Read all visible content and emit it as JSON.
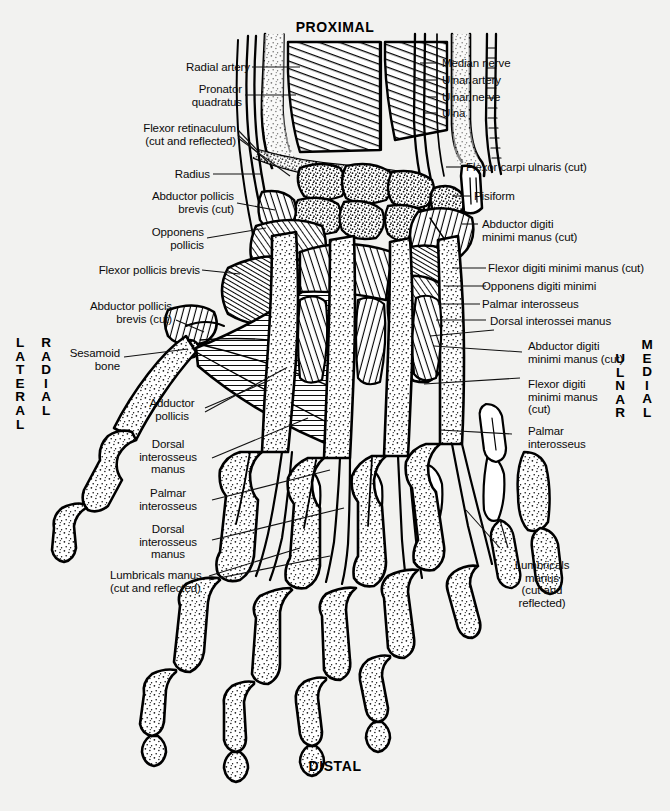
{
  "figure": {
    "title_top": "PROXIMAL",
    "title_bottom": "DISTAL",
    "orientation": {
      "left_outer": "L\nA\nT\nE\nR\nA\nL",
      "left_inner": "R\nA\nD\nI\nA\nL",
      "right_inner": "U\nL\nN\nA\nR",
      "right_outer": "M\nE\nD\nI\nA\nL"
    },
    "background_color": "#f2f2f0",
    "ink_color": "#000000"
  },
  "labels_left": [
    {
      "id": "radial-artery",
      "text": "Radial artery"
    },
    {
      "id": "pronator-quadratus",
      "text": "Pronator\nquadratus"
    },
    {
      "id": "flexor-retinaculum",
      "text": "Flexor retinaculum\n(cut and reflected)"
    },
    {
      "id": "radius",
      "text": "Radius"
    },
    {
      "id": "abductor-pollicis-brevis-cut-upper",
      "text": "Abductor pollicis\nbrevis (cut)"
    },
    {
      "id": "opponens-pollicis",
      "text": "Opponens\npollicis"
    },
    {
      "id": "flexor-pollicis-brevis",
      "text": "Flexor pollicis brevis"
    },
    {
      "id": "abductor-pollicis-brevis-cut-lower",
      "text": "Abductor pollicis\nbrevis (cut)"
    },
    {
      "id": "sesamoid-bone",
      "text": "Sesamoid\nbone"
    },
    {
      "id": "adductor-pollicis",
      "text": "Adductor\npollicis"
    },
    {
      "id": "dorsal-interosseus-manus-upper",
      "text": "Dorsal\ninterosseus\nmanus"
    },
    {
      "id": "palmar-interosseus-left",
      "text": "Palmar\ninterosseus"
    },
    {
      "id": "dorsal-interosseus-manus-lower",
      "text": "Dorsal\ninterosseus\nmanus"
    },
    {
      "id": "lumbricals-manus-left",
      "text": "Lumbricals manus\n(cut and reflected)"
    }
  ],
  "labels_right": [
    {
      "id": "median-nerve",
      "text": "Median nerve"
    },
    {
      "id": "ulnar-artery",
      "text": "Ulnar artery"
    },
    {
      "id": "ulnar-nerve",
      "text": "Ulnar nerve"
    },
    {
      "id": "ulna",
      "text": "Ulna"
    },
    {
      "id": "flexor-carpi-ulnaris-cut",
      "text": "Flexor carpi ulnaris (cut)"
    },
    {
      "id": "pisiform",
      "text": "Pisiform"
    },
    {
      "id": "abductor-digiti-minimi-manus-cut-upper",
      "text": "Abductor digiti\nminimi manus (cut)"
    },
    {
      "id": "flexor-digiti-minimi-manus-cut",
      "text": "Flexor digiti minimi manus (cut)"
    },
    {
      "id": "opponens-digiti-minimi",
      "text": "Opponens digiti minimi"
    },
    {
      "id": "palmar-interosseus-upper-right",
      "text": "Palmar interosseus"
    },
    {
      "id": "dorsal-interossei-manus",
      "text": "Dorsal interossei manus"
    },
    {
      "id": "abductor-digiti-minimi-manus-cut-lower",
      "text": "Abductor digiti\nminimi manus (cut)"
    },
    {
      "id": "flexor-digiti-minimi-manus-cut-lower",
      "text": "Flexor digiti\nminimi manus\n(cut)"
    },
    {
      "id": "palmar-interosseus-lower-right",
      "text": "Palmar\ninterosseus"
    },
    {
      "id": "lumbricals-manus-right",
      "text": "Lumbricals\nmanus\n(cut and\nreflected)"
    }
  ]
}
